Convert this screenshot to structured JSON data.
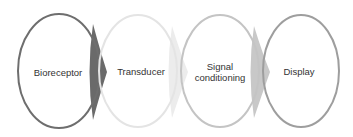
{
  "diagram": {
    "type": "process-flow",
    "stages": [
      {
        "label": "Bioreceptor",
        "cx": 59,
        "stroke": "#6e6e6e"
      },
      {
        "label": "Transducer",
        "cx": 138,
        "stroke": "#e4e4e4"
      },
      {
        "label": "Signal\nconditioning",
        "line1": "Signal",
        "line2": "conditioning",
        "cx": 220,
        "stroke": "#c4c4c4"
      },
      {
        "label": "Display",
        "cx": 301,
        "stroke": "#9e9e9e"
      }
    ],
    "connectors": [
      {
        "from": "Bioreceptor",
        "to": "Transducer",
        "fill": "#6a6a6a"
      },
      {
        "from": "Transducer",
        "to": "Signal conditioning",
        "fill": "#ececec"
      },
      {
        "from": "Signal conditioning",
        "to": "Display",
        "fill": "#c8c8c8"
      }
    ]
  }
}
